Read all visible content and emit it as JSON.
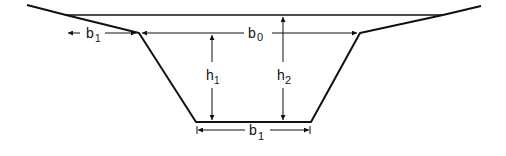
{
  "diagram": {
    "type": "trapezoidal channel cross-section",
    "colors": {
      "line": "#111111",
      "background": "#ffffff"
    },
    "labels": {
      "b0": {
        "main": "b",
        "sub": "0"
      },
      "b1_top": {
        "main": "b",
        "sub": "1"
      },
      "b1_bottom": {
        "main": "b",
        "sub": "1"
      },
      "h1": {
        "main": "h",
        "sub": "1"
      },
      "h2": {
        "main": "h",
        "sub": "2"
      }
    }
  }
}
